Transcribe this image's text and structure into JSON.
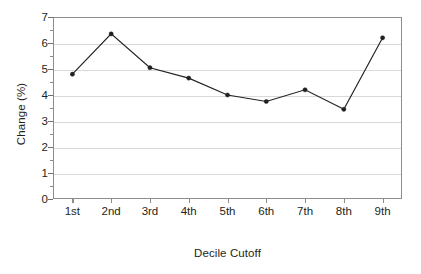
{
  "chart_data": {
    "type": "line",
    "title": "",
    "xlabel": "Decile Cutoff",
    "ylabel": "Change (%)",
    "categories": [
      "1st",
      "2nd",
      "3rd",
      "4th",
      "5th",
      "6th",
      "7th",
      "8th",
      "9th"
    ],
    "values": [
      4.8,
      6.35,
      5.05,
      4.65,
      4.0,
      3.75,
      4.2,
      3.45,
      6.2
    ],
    "series": [
      {
        "name": "Change (%)",
        "values": [
          4.8,
          6.35,
          5.05,
          4.65,
          4.0,
          3.75,
          4.2,
          3.45,
          6.2
        ]
      }
    ],
    "ylim": [
      0,
      7
    ],
    "yticks": [
      0,
      1,
      2,
      3,
      4,
      5,
      6,
      7
    ],
    "ytick_labels": [
      "0",
      "1",
      "2",
      "3",
      "4",
      "5",
      "6",
      "7"
    ],
    "grid": true,
    "grid_axis": "y",
    "legend": false,
    "legend_position": "none",
    "marker": "filled-circle",
    "line_color": "#231f20",
    "grid_color": "#d9d9d9",
    "frame_color": "#8c8c8c",
    "background_color": "#ffffff"
  }
}
